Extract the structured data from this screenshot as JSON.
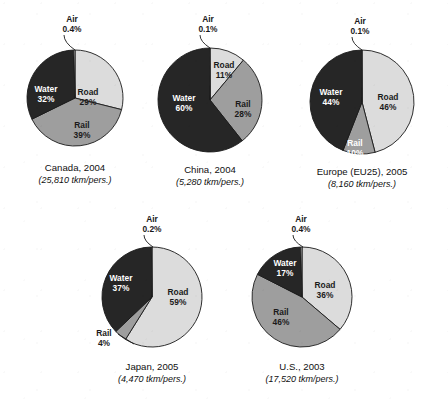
{
  "figure": {
    "type": "pie-chart-panel",
    "background": "#ffffff",
    "width": 448,
    "height": 406
  },
  "palette": {
    "road": "#dcdcdc",
    "rail": "#9e9e9e",
    "water": "#262626",
    "air": "#f2f2f2",
    "outline": "#1a1a1a",
    "label_on_dark": "#ffffff",
    "label_on_light": "#1a1a1a",
    "caption": "#101010"
  },
  "categories": [
    "Road",
    "Rail",
    "Water",
    "Air"
  ],
  "chart_data": [
    {
      "type": "pie",
      "title": "Canada, 2004",
      "subtitle": "(25,810 tkm/pers.)",
      "categories": [
        "Road",
        "Rail",
        "Water",
        "Air"
      ],
      "values": [
        29,
        39,
        32,
        0.4
      ],
      "labels": [
        "Road",
        "Rail",
        "Water",
        "Air"
      ],
      "value_labels": [
        "29%",
        "39%",
        "32%",
        "0.4%"
      ],
      "cx": 75,
      "cy": 98,
      "r": 48,
      "start_angle_deg": 0,
      "label_positions": [
        {
          "x": 88,
          "y": 95,
          "on": "light"
        },
        {
          "x": 82,
          "y": 128,
          "on": "light"
        },
        {
          "x": 46,
          "y": 92,
          "on": "dark"
        }
      ],
      "callout": {
        "label": "Air",
        "value": "0.4%",
        "x": 72,
        "y": 22,
        "tip_x": 75,
        "tip_y": 50
      }
    },
    {
      "type": "pie",
      "title": "China, 2004",
      "subtitle": "(5,280 tkm/pers.)",
      "categories": [
        "Road",
        "Rail",
        "Water",
        "Air"
      ],
      "values": [
        11,
        28,
        60,
        0.1
      ],
      "labels": [
        "Road",
        "Rail",
        "Water",
        "Air"
      ],
      "value_labels": [
        "11%",
        "28%",
        "60%",
        "0.1%"
      ],
      "cx": 210,
      "cy": 100,
      "r": 52,
      "start_angle_deg": 0,
      "label_positions": [
        {
          "x": 224,
          "y": 68,
          "on": "light"
        },
        {
          "x": 243,
          "y": 107,
          "on": "light"
        },
        {
          "x": 184,
          "y": 101,
          "on": "dark"
        }
      ],
      "callout": {
        "label": "Air",
        "value": "0.1%",
        "x": 208,
        "y": 22,
        "tip_x": 210,
        "tip_y": 48
      }
    },
    {
      "type": "pie",
      "title": "Europe (EU25), 2005",
      "subtitle": "(8,160 tkm/pers.)",
      "categories": [
        "Road",
        "Rail",
        "Water",
        "Air"
      ],
      "values": [
        46,
        10,
        44,
        0.1
      ],
      "labels": [
        "Road",
        "Rail",
        "Water",
        "Air"
      ],
      "value_labels": [
        "46%",
        "10%",
        "44%",
        "0.1%"
      ],
      "cx": 362,
      "cy": 102,
      "r": 52,
      "start_angle_deg": 0,
      "label_positions": [
        {
          "x": 388,
          "y": 100,
          "on": "light"
        },
        {
          "x": 355,
          "y": 146,
          "on": "dark"
        },
        {
          "x": 331,
          "y": 95,
          "on": "dark"
        }
      ],
      "callout": {
        "label": "Air",
        "value": "0.1%",
        "x": 360,
        "y": 24,
        "tip_x": 362,
        "tip_y": 50
      }
    },
    {
      "type": "pie",
      "title": "Japan, 2005",
      "subtitle": "(4,470 tkm/pers.)",
      "categories": [
        "Road",
        "Rail",
        "Water",
        "Air"
      ],
      "values": [
        59,
        4,
        37,
        0.2
      ],
      "labels": [
        "Road",
        "Rail",
        "Water",
        "Air"
      ],
      "value_labels": [
        "59%",
        "4%",
        "37%",
        "0.2%"
      ],
      "cx": 152,
      "cy": 297,
      "r": 50,
      "start_angle_deg": 0,
      "label_positions": [
        {
          "x": 178,
          "y": 295,
          "on": "light"
        },
        {
          "x": 121,
          "y": 281,
          "on": "dark"
        }
      ],
      "callout": {
        "label": "Air",
        "value": "0.2%",
        "x": 152,
        "y": 222,
        "tip_x": 153,
        "tip_y": 247
      },
      "callout2": {
        "label": "Rail",
        "value": "4%",
        "x": 104,
        "y": 336,
        "tip_x": 134,
        "tip_y": 344
      }
    },
    {
      "type": "pie",
      "title": "U.S., 2003",
      "subtitle": "(17,520 tkm/pers.)",
      "categories": [
        "Road",
        "Rail",
        "Water",
        "Air"
      ],
      "values": [
        36,
        46,
        17,
        0.4
      ],
      "labels": [
        "Road",
        "Rail",
        "Water",
        "Air"
      ],
      "value_labels": [
        "36%",
        "46%",
        "17%",
        "0.4%"
      ],
      "cx": 302,
      "cy": 297,
      "r": 50,
      "start_angle_deg": 0,
      "label_positions": [
        {
          "x": 325,
          "y": 288,
          "on": "light"
        },
        {
          "x": 281,
          "y": 315,
          "on": "light"
        },
        {
          "x": 285,
          "y": 266,
          "on": "dark"
        }
      ],
      "callout": {
        "label": "Air",
        "value": "0.4%",
        "x": 301,
        "y": 222,
        "tip_x": 303,
        "tip_y": 247
      }
    }
  ],
  "captions": {
    "canada": {
      "title": "Canada, 2004",
      "sub": "(25,810 tkm/pers.)",
      "x": 75,
      "y": 171
    },
    "china": {
      "title": "China, 2004",
      "sub": "(5,280 tkm/pers.)",
      "x": 210,
      "y": 173
    },
    "europe": {
      "title": "Europe (EU25), 2005",
      "sub": "(8,160 tkm/pers.)",
      "x": 362,
      "y": 175
    },
    "japan": {
      "title": "Japan, 2005",
      "sub": "(4,470 tkm/pers.)",
      "x": 152,
      "y": 370
    },
    "us": {
      "title": "U.S., 2003",
      "sub": "(17,520 tkm/pers.)",
      "x": 302,
      "y": 370
    }
  }
}
